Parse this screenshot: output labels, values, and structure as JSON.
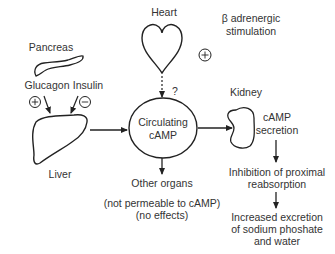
{
  "diagram": {
    "heart": {
      "label": "Heart",
      "question_mark": "?"
    },
    "beta": {
      "line1": "β adrenergic",
      "line2": "stimulation",
      "sign": "+"
    },
    "pancreas": {
      "label": "Pancreas"
    },
    "glucagon": {
      "label": "Glucagon",
      "sign": "+"
    },
    "insulin": {
      "label": "Insulin",
      "sign": "−"
    },
    "liver": {
      "label": "Liver"
    },
    "center": {
      "line1": "Circulating",
      "line2": "cAMP"
    },
    "other_organs": {
      "line1": "Other organs",
      "line2": "(not permeable to cAMP)",
      "line3": "(no effects)"
    },
    "kidney": {
      "label": "Kidney"
    },
    "secretion": {
      "line1": "cAMP",
      "line2": "secretion"
    },
    "inhibition": {
      "line1": "Inhibition of proximal",
      "line2": "reabsorption"
    },
    "excretion": {
      "line1": "Increased excretion",
      "line2": "of sodium phoshate",
      "line3": "and water"
    }
  }
}
